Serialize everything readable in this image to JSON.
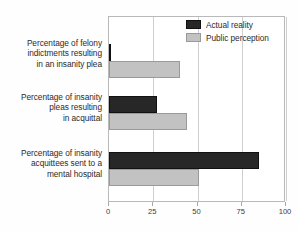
{
  "chart_data": {
    "type": "bar",
    "orientation": "horizontal",
    "title": "",
    "xlabel": "",
    "ylabel": "",
    "xlim": [
      0,
      100
    ],
    "xticks": [
      0,
      25,
      50,
      75,
      100
    ],
    "xtick_labels": [
      "0",
      "25",
      "50",
      "75",
      "100"
    ],
    "grid": true,
    "legend_position": "top-right",
    "categories": [
      "Percentage of felony indictments resulting in an insanity plea",
      "Percentage of insanity pleas resulting in acquittal",
      "Percentage of insanity acquittees sent to a mental hospital"
    ],
    "category_lines": [
      [
        "Percentage of felony",
        "indictments resulting",
        "in an insanity plea"
      ],
      [
        "Percentage of insanity",
        "pleas resulting",
        "in acquittal"
      ],
      [
        "Percentage of insanity",
        "acquittees sent to a",
        "mental hospital"
      ]
    ],
    "series": [
      {
        "name": "Actual reality",
        "color": "#272727",
        "values": [
          1,
          27,
          85
        ]
      },
      {
        "name": "Public perception",
        "color": "#c2c2c2",
        "values": [
          40,
          44,
          51
        ]
      }
    ]
  },
  "legend": {
    "items": [
      {
        "label": "Actual reality",
        "swatch": "actual"
      },
      {
        "label": "Public perception",
        "swatch": "perception"
      }
    ]
  },
  "axis": {
    "tick_labels": [
      "0",
      "25",
      "50",
      "75",
      "100"
    ]
  },
  "colors": {
    "actual": "#272727",
    "perception": "#c2c2c2",
    "grid": "#cfcfcf",
    "frame": "#b9b9b9",
    "text": "#2b2b2b",
    "background": "#fefefe"
  }
}
